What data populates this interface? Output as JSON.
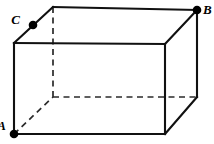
{
  "figure": {
    "type": "geometry-diagram",
    "shape": "rectangular prism (cuboid)",
    "projection": "oblique",
    "background_color": "#ffffff",
    "line_color": "#111111",
    "hidden_line_color": "#2a2a2a",
    "marker_color": "#000000",
    "canvas": {
      "width": 214,
      "height": 144
    }
  },
  "labels": {
    "a": "A",
    "b": "B",
    "c": "C"
  },
  "label_positions": {
    "a": {
      "x": 6,
      "y": 127
    },
    "b": {
      "x": 203,
      "y": 11
    },
    "c": {
      "x": 20,
      "y": 21
    }
  },
  "points": [
    {
      "id": "A",
      "label": "A",
      "x": 14,
      "y": 134,
      "description": "front-bottom-left vertex"
    },
    {
      "id": "B",
      "label": "B",
      "x": 197,
      "y": 10,
      "description": "back-top-right vertex"
    },
    {
      "id": "C",
      "label": "C",
      "x": 33,
      "y": 25,
      "description": "midpoint of top-left receding edge"
    }
  ],
  "vertices": {
    "front_top_left": {
      "x": 14,
      "y": 43
    },
    "front_top_right": {
      "x": 165,
      "y": 44
    },
    "front_bottom_right": {
      "x": 165,
      "y": 134
    },
    "front_bottom_left": {
      "x": 14,
      "y": 134
    },
    "back_top_left": {
      "x": 53,
      "y": 7
    },
    "back_top_right": {
      "x": 197,
      "y": 10
    },
    "back_bottom_right": {
      "x": 197,
      "y": 97
    },
    "back_bottom_left": {
      "x": 53,
      "y": 97
    }
  },
  "edges_solid": [
    {
      "name": "front-top-edge",
      "x1": 14,
      "y1": 43,
      "x2": 165,
      "y2": 44
    },
    {
      "name": "front-right-edge",
      "x1": 165,
      "y1": 44,
      "x2": 165,
      "y2": 134
    },
    {
      "name": "front-bottom-edge",
      "x1": 165,
      "y1": 134,
      "x2": 14,
      "y2": 134
    },
    {
      "name": "front-left-edge",
      "x1": 14,
      "y1": 134,
      "x2": 14,
      "y2": 43
    },
    {
      "name": "top-left-receding-edge",
      "x1": 14,
      "y1": 43,
      "x2": 53,
      "y2": 7
    },
    {
      "name": "back-top-edge",
      "x1": 53,
      "y1": 7,
      "x2": 197,
      "y2": 10
    },
    {
      "name": "top-right-receding-edge",
      "x1": 165,
      "y1": 44,
      "x2": 197,
      "y2": 10
    },
    {
      "name": "back-right-vertical-edge",
      "x1": 197,
      "y1": 10,
      "x2": 197,
      "y2": 97
    },
    {
      "name": "bottom-right-receding-edge",
      "x1": 165,
      "y1": 134,
      "x2": 197,
      "y2": 97
    }
  ],
  "edges_dashed": [
    {
      "name": "hidden-back-left-vertical-edge",
      "x1": 53,
      "y1": 7,
      "x2": 53,
      "y2": 97
    },
    {
      "name": "hidden-back-bottom-edge",
      "x1": 53,
      "y1": 97,
      "x2": 197,
      "y2": 97
    },
    {
      "name": "hidden-bottom-left-receding-edge",
      "x1": 14,
      "y1": 134,
      "x2": 53,
      "y2": 97
    }
  ]
}
